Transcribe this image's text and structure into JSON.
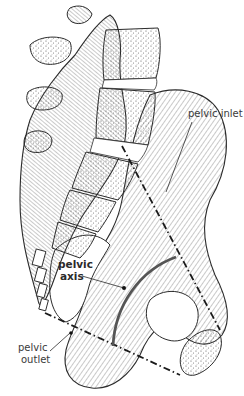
{
  "figure": {
    "labels": {
      "pelvic_inlet": "pelvic inlet",
      "pelvic_axis_line1": "pelvic",
      "pelvic_axis_line2": "axis",
      "pelvic_outlet_line1": "pelvic",
      "pelvic_outlet_line2": "outlet"
    },
    "colors": {
      "ink": "#2b2b2b",
      "axis_curve": "#555555",
      "label_text": "#3a3a3a",
      "background": "#ffffff"
    }
  }
}
